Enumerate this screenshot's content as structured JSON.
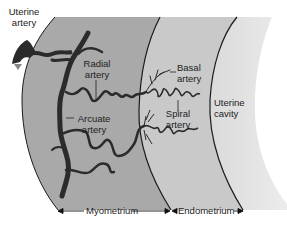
{
  "figure": {
    "type": "anatomical-diagram"
  },
  "regions": [
    {
      "id": "myometrium",
      "label": "Myometrium",
      "fill": "#a9a9a9"
    },
    {
      "id": "endometrium",
      "label": "Endometrium",
      "fill": "#c9c9c9"
    },
    {
      "id": "uterine_cavity",
      "label": "Uterine cavity",
      "fill": "#e2e2e2"
    }
  ],
  "labels": {
    "uterine_artery": [
      "Uterine",
      "artery"
    ],
    "radial_artery": [
      "Radial",
      "artery"
    ],
    "arcuate_artery": [
      "Arcuate",
      "artery"
    ],
    "basal_artery": [
      "Basal",
      "artery"
    ],
    "spiral_artery": [
      "Spiral",
      "artery"
    ],
    "uterine_cavity": [
      "Uterine",
      "cavity"
    ],
    "myometrium": "Myometrium",
    "endometrium": "Endometrium"
  },
  "colors": {
    "artery": "#2b2b2b",
    "boundary": "#1a1a1a",
    "text": "#222222"
  }
}
